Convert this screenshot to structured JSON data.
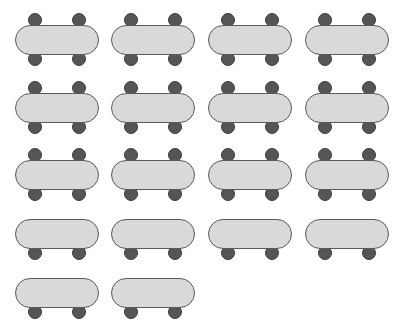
{
  "diagram": {
    "title": "",
    "type": "seating-layout",
    "colors": {
      "table_fill": "#d9d9d9",
      "table_stroke": "#5a5a5a",
      "chair_fill": "#555555",
      "background": "#ffffff"
    },
    "table_width": 83,
    "table_height": 29,
    "chair_offsets_x": [
      19,
      63
    ],
    "columns_x": [
      15,
      111,
      208,
      305
    ],
    "rows": [
      {
        "y": 25,
        "chairs_top": true,
        "chairs_bottom": true,
        "count": 4
      },
      {
        "y": 93,
        "chairs_top": true,
        "chairs_bottom": true,
        "count": 4
      },
      {
        "y": 160,
        "chairs_top": true,
        "chairs_bottom": true,
        "count": 4
      },
      {
        "y": 219,
        "chairs_top": false,
        "chairs_bottom": true,
        "count": 4
      },
      {
        "y": 278,
        "chairs_top": false,
        "chairs_bottom": true,
        "count": 2
      }
    ],
    "total_tables": 18
  }
}
